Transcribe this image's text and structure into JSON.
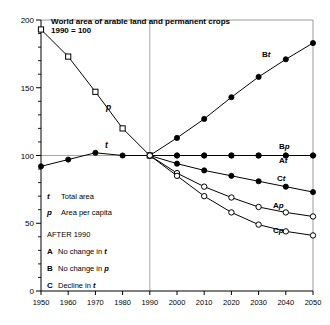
{
  "chart_data": {
    "type": "line",
    "title": "World area of arable land and permanent crops",
    "subtitle": "1990 = 100",
    "xlabel": "",
    "ylabel": "",
    "xlim": [
      1950,
      2050
    ],
    "ylim": [
      0,
      200
    ],
    "grid": "reference line at 100 and vertical line at 1990",
    "legend_position": "inline at line ends (right) and text block lower-left",
    "x_ticks": [
      "1950",
      "1960",
      "1970",
      "1980",
      "1990",
      "2000",
      "2010",
      "2020",
      "2030",
      "2040",
      "2050"
    ],
    "y_ticks": [
      "0",
      "50",
      "100",
      "150",
      "200"
    ],
    "y_minor_tick_step": 10,
    "series": [
      {
        "name": "p",
        "label": "p",
        "description": "Area per capita, historical 1950-1990",
        "marker": "open-square",
        "x": [
          1950,
          1960,
          1970,
          1980,
          1990
        ],
        "values": [
          193,
          173,
          147,
          120,
          100
        ]
      },
      {
        "name": "t",
        "label": "t",
        "description": "Total area, historical 1950-1990",
        "marker": "filled-circle",
        "x": [
          1950,
          1960,
          1970,
          1980,
          1990
        ],
        "values": [
          92,
          97,
          102,
          100,
          100
        ]
      },
      {
        "name": "Bt",
        "label": "Bt",
        "description": "Total area under scenario B (no change in p)",
        "marker": "filled-circle",
        "x": [
          1990,
          2000,
          2010,
          2020,
          2030,
          2040,
          2050
        ],
        "values": [
          100,
          113,
          127,
          143,
          158,
          171,
          183
        ]
      },
      {
        "name": "Bp",
        "label": "Bp",
        "description": "Area per capita under scenario B (no change in p)",
        "marker": "filled-circle",
        "x": [
          1990,
          2000,
          2010,
          2020,
          2030,
          2040,
          2050
        ],
        "values": [
          100,
          100,
          100,
          100,
          100,
          100,
          100
        ]
      },
      {
        "name": "At",
        "label": "At",
        "description": "Total area under scenario A (no change in t)",
        "marker": "filled-circle",
        "x": [
          1990,
          2000,
          2010,
          2020,
          2030,
          2040,
          2050
        ],
        "values": [
          100,
          100,
          100,
          100,
          100,
          100,
          100
        ]
      },
      {
        "name": "Ct",
        "label": "Ct",
        "description": "Total area under scenario C (decline in t)",
        "marker": "filled-circle",
        "x": [
          1990,
          2000,
          2010,
          2020,
          2030,
          2040,
          2050
        ],
        "values": [
          100,
          94,
          89,
          85,
          81,
          77,
          73
        ]
      },
      {
        "name": "Ap",
        "label": "Ap",
        "description": "Area per capita under scenario A (no change in t)",
        "marker": "open-circle",
        "x": [
          1990,
          2000,
          2010,
          2020,
          2030,
          2040,
          2050
        ],
        "values": [
          100,
          87,
          77,
          69,
          62,
          58,
          55
        ]
      },
      {
        "name": "Cp",
        "label": "Cp",
        "description": "Area per capita under scenario C (decline in t)",
        "marker": "open-circle",
        "x": [
          1990,
          2000,
          2010,
          2020,
          2030,
          2040,
          2050
        ],
        "values": [
          100,
          85,
          70,
          58,
          49,
          44,
          41
        ]
      }
    ],
    "annotations": [
      {
        "text": "p",
        "note": "historical area per capita curve label"
      },
      {
        "text": "t",
        "note": "historical total area curve label"
      }
    ]
  },
  "legend": {
    "keys": [
      {
        "symbol": "t",
        "text": "Total area"
      },
      {
        "symbol": "p",
        "text": "Area per capita"
      }
    ],
    "heading": "AFTER 1990",
    "scenarios": [
      {
        "symbol": "A",
        "text": "No change in t"
      },
      {
        "symbol": "B",
        "text": "No change in p"
      },
      {
        "symbol": "C",
        "text": "Decline in t"
      }
    ]
  },
  "colors": {
    "ink": "#000000",
    "frame": "#9a9a9a",
    "grid": "#a8a8a8",
    "background": "#ffffff"
  }
}
